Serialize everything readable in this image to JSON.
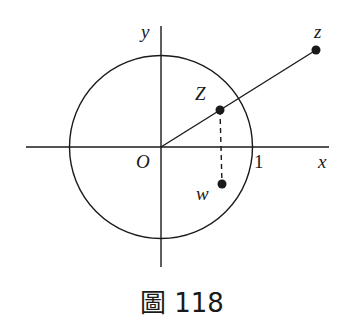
{
  "figure": {
    "caption": "圖 118",
    "labels": {
      "y_axis": "y",
      "x_axis": "x",
      "origin": "O",
      "unit": "1",
      "point_z": "z",
      "point_Z": "Z",
      "point_w": "w"
    },
    "colors": {
      "ink": "#1a1a1a",
      "background": "#ffffff"
    }
  }
}
